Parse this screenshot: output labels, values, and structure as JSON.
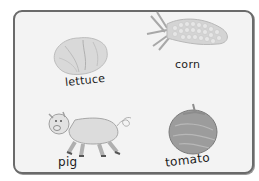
{
  "card": {
    "items": [
      {
        "id": "lettuce",
        "label": "lettuce",
        "picture": "lettuce-drawing"
      },
      {
        "id": "corn",
        "label": "corn",
        "picture": "corn-drawing"
      },
      {
        "id": "pig",
        "label": "pig",
        "picture": "pig-drawing"
      },
      {
        "id": "tomato",
        "label": "tomato",
        "picture": "tomato-drawing"
      }
    ]
  },
  "colors": {
    "background": "#ffffff",
    "card_fill": "#f3f3f3",
    "card_border": "#6a6a6a",
    "drawing_gray": "#c4c4c4",
    "drawing_dark": "#7d7d7d",
    "text": "#1c1c1c"
  }
}
